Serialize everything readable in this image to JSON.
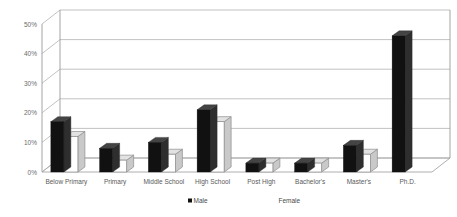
{
  "chart_data": {
    "type": "bar",
    "title": "",
    "subtitle": "",
    "xlabel": "",
    "ylabel": "",
    "categories": [
      "Below Primary",
      "Primary",
      "Middle School",
      "High School",
      "Post High",
      "Bachelor's",
      "Master's",
      "Ph.D."
    ],
    "series": [
      {
        "name": "Male",
        "values": [
          17,
          8,
          10,
          21,
          3,
          3,
          9,
          46
        ]
      },
      {
        "name": "Female",
        "values": [
          12,
          4,
          6,
          17,
          3,
          3,
          6,
          0
        ]
      }
    ],
    "ytick_labels": [
      "0%",
      "10%",
      "20%",
      "30%",
      "40%",
      "50%"
    ],
    "ytick_values": [
      0,
      10,
      20,
      30,
      40,
      50
    ],
    "ylim": [
      0,
      50
    ],
    "grid": true,
    "legend_position": "bottom",
    "style": "3d-clustered-column",
    "colors": {
      "male": "#111111",
      "female": "#ffffff",
      "male_side": "#2e2e2e",
      "female_side": "#c9c9c9",
      "gridline": "#a8a8a8",
      "axis": "#9a9a9a",
      "text": "#4a4a4a",
      "background": "#ffffff"
    }
  },
  "legend": {
    "items": [
      {
        "label": "Male",
        "marker": "filled-square"
      },
      {
        "label": "Female",
        "marker": "hollow-square"
      }
    ]
  }
}
